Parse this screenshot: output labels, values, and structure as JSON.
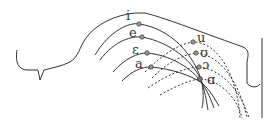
{
  "diagram": {
    "front_vowels": [
      {
        "symbol": "i",
        "label_x": 128,
        "label_y": 20,
        "dot_x": 139,
        "dot_y": 24
      },
      {
        "symbol": "e",
        "label_x": 129,
        "label_y": 37,
        "dot_x": 142,
        "dot_y": 37
      },
      {
        "symbol": "ε",
        "label_x": 132,
        "label_y": 54,
        "dot_x": 147,
        "dot_y": 53
      },
      {
        "symbol": "a",
        "label_x": 135,
        "label_y": 68,
        "dot_x": 151,
        "dot_y": 67
      }
    ],
    "back_vowels": [
      {
        "symbol": "u",
        "label_x": 198,
        "label_y": 42,
        "dot_x": 193,
        "dot_y": 42
      },
      {
        "symbol": "ʊ",
        "label_x": 201,
        "label_y": 57,
        "dot_x": 196,
        "dot_y": 53
      },
      {
        "symbol": "ɔ",
        "label_x": 202,
        "label_y": 69,
        "dot_x": 199,
        "dot_y": 67
      },
      {
        "symbol": "ɑ",
        "label_x": 208,
        "label_y": 84,
        "dot_x": 200,
        "dot_y": 79
      }
    ],
    "colors": {
      "line": "#333333",
      "dot_fill": "#999999"
    }
  }
}
